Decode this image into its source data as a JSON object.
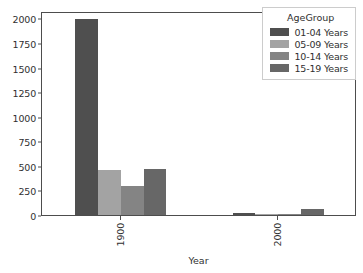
{
  "chart_data": {
    "type": "bar",
    "title": "",
    "xlabel": "Year",
    "ylabel": "",
    "categories": [
      "1900",
      "2000"
    ],
    "series": [
      {
        "name": "01-04 Years",
        "color": "#4f4f4f",
        "values": [
          1995,
          25
        ]
      },
      {
        "name": "05-09 Years",
        "color": "#a3a3a3",
        "values": [
          460,
          8
        ]
      },
      {
        "name": "10-14 Years",
        "color": "#848484",
        "values": [
          298,
          15
        ]
      },
      {
        "name": "15-19 Years",
        "color": "#676767",
        "values": [
          472,
          60
        ]
      }
    ],
    "ylim": [
      0,
      2075
    ],
    "yticks": [
      0,
      250,
      500,
      750,
      1000,
      1250,
      1500,
      1750,
      2000
    ],
    "ytick_labels": [
      "0",
      "250",
      "500",
      "750",
      "1000",
      "1250",
      "1500",
      "1750",
      "2000"
    ],
    "xtick_labels": [
      "1900",
      "2000"
    ],
    "grid": false,
    "legend": {
      "title": "AgeGroup",
      "position": "upper right",
      "entries": [
        "01-04 Years",
        "05-09 Years",
        "10-14 Years",
        "15-19 Years"
      ]
    },
    "axis_color": "#4d4d4d",
    "text_color": "#303030",
    "background": "#ffffff"
  }
}
